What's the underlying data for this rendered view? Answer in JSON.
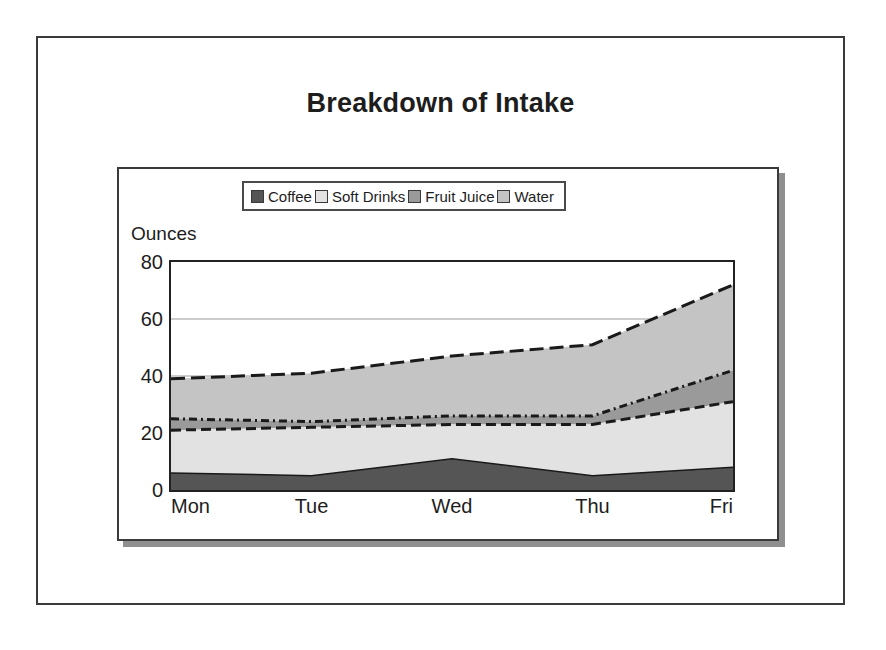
{
  "slide": {
    "title": "Breakdown of Intake"
  },
  "chart_data": {
    "type": "area",
    "stacked": true,
    "title": "Breakdown of Intake",
    "xlabel": "",
    "ylabel": "Ounces",
    "categories": [
      "Mon",
      "Tue",
      "Wed",
      "Thu",
      "Fri"
    ],
    "ylim": [
      0,
      80
    ],
    "yticks": [
      0,
      20,
      40,
      60,
      80
    ],
    "grid": true,
    "grid_axis": "y",
    "legend_position": "top",
    "series": [
      {
        "name": "Coffee",
        "color": "#555555",
        "values": [
          6,
          5,
          11,
          5,
          8
        ]
      },
      {
        "name": "Soft Drinks",
        "color": "#e2e2e2",
        "values": [
          15,
          17,
          12,
          18,
          23
        ]
      },
      {
        "name": "Fruit Juice",
        "color": "#9a9a9a",
        "values": [
          4,
          2,
          3,
          3,
          11
        ]
      },
      {
        "name": "Water",
        "color": "#c4c4c4",
        "values": [
          14,
          17,
          21,
          25,
          30
        ]
      }
    ],
    "cumulative_tops": {
      "Coffee": [
        6,
        5,
        11,
        5,
        8
      ],
      "Soft Drinks": [
        21,
        22,
        23,
        23,
        31
      ],
      "Fruit Juice": [
        25,
        24,
        26,
        26,
        42
      ],
      "Water": [
        39,
        41,
        47,
        51,
        72
      ]
    }
  }
}
